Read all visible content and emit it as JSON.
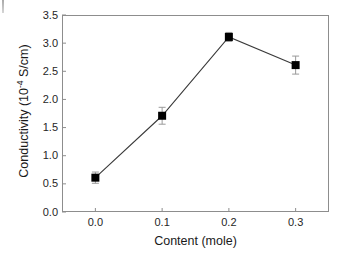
{
  "chart_data": {
    "type": "line",
    "title": "",
    "subtitle": "",
    "xlabel": "Content (mole)",
    "ylabel_text": "Conductivity (10",
    "ylabel_sup": "-4",
    "ylabel_tail": " S/cm)",
    "ylabel_full": "Conductivity (10-4 S/cm)",
    "x": [
      0.0,
      0.1,
      0.2,
      0.3
    ],
    "values": [
      0.61,
      1.71,
      3.11,
      2.61
    ],
    "errors": [
      0.1,
      0.15,
      0.08,
      0.16
    ],
    "xtick_labels": [
      "0.0",
      "0.1",
      "0.2",
      "0.3"
    ],
    "ytick_labels": [
      "0.0",
      "0.5",
      "1.0",
      "1.5",
      "2.0",
      "2.5",
      "3.0",
      "3.5"
    ],
    "ytick_values": [
      0.0,
      0.5,
      1.0,
      1.5,
      2.0,
      2.5,
      3.0,
      3.5
    ],
    "xlim": [
      -0.05,
      0.35
    ],
    "ylim": [
      0.0,
      3.5
    ],
    "grid": false,
    "legend": "none",
    "marker": "filled-square",
    "marker_color": "#000000",
    "line_color": "#3a3a3a",
    "errorbar_color": "#9a9a9a",
    "axis_color": "#8d8d8d",
    "background": "#ffffff"
  }
}
